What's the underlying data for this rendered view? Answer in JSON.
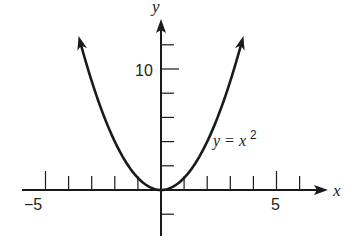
{
  "chart_data": {
    "type": "line",
    "title": "",
    "equation_label": "y = x²",
    "equation_base": "y = x",
    "equation_exponent": "2",
    "xlabel": "x",
    "ylabel": "y",
    "x_tick_labels": [
      {
        "value": -5,
        "label": "−5"
      },
      {
        "value": 5,
        "label": "5"
      }
    ],
    "y_tick_labels": [
      {
        "value": 10,
        "label": "10"
      }
    ],
    "x_ticks": [
      -5,
      -4,
      -3,
      -2,
      -1,
      1,
      2,
      3,
      4,
      5,
      6
    ],
    "y_ticks": [
      -2,
      2,
      4,
      6,
      8,
      10,
      12
    ],
    "xlim": [
      -6,
      7
    ],
    "ylim": [
      -4,
      14
    ],
    "grid": false,
    "series": [
      {
        "name": "y = x^2",
        "x": [
          -3.5,
          -3,
          -2.5,
          -2,
          -1.5,
          -1,
          -0.5,
          0,
          0.5,
          1,
          1.5,
          2,
          2.5,
          3,
          3.5
        ],
        "y": [
          12.25,
          9,
          6.25,
          4,
          2.25,
          1,
          0.25,
          0,
          0.25,
          1,
          2.25,
          4,
          6.25,
          9,
          12.25
        ]
      }
    ],
    "colors": {
      "curve": "#1a1a1a",
      "axes": "#1a1a1a",
      "background": "#ffffff"
    }
  }
}
